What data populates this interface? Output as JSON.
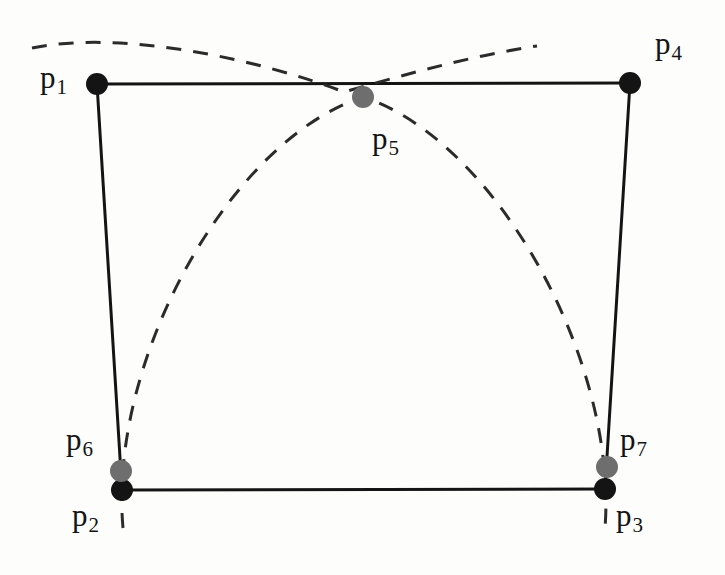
{
  "figure": {
    "kind": "geometry-diagram",
    "width": 725,
    "height": 575,
    "background_color": "#fdfdfc",
    "stroke_color": "#141414",
    "dash_color": "#2b2b2b",
    "vertex_fill_black": "#141414",
    "vertex_fill_gray": "#6e6e6e"
  },
  "points": [
    {
      "id": "p1",
      "label": "p",
      "sub": "1",
      "x": 97,
      "y": 84,
      "color": "#141414",
      "radius": 11,
      "label_x": 40,
      "label_y": 62
    },
    {
      "id": "p2",
      "label": "p",
      "sub": "2",
      "x": 122,
      "y": 490,
      "color": "#141414",
      "radius": 11,
      "label_x": 72,
      "label_y": 500
    },
    {
      "id": "p3",
      "label": "p",
      "sub": "3",
      "x": 605,
      "y": 489,
      "color": "#141414",
      "radius": 11,
      "label_x": 616,
      "label_y": 500
    },
    {
      "id": "p4",
      "label": "p",
      "sub": "4",
      "x": 630,
      "y": 83,
      "color": "#141414",
      "radius": 11,
      "label_x": 655,
      "label_y": 28
    },
    {
      "id": "p5",
      "label": "p",
      "sub": "5",
      "x": 363,
      "y": 97,
      "color": "#6e6e6e",
      "radius": 11,
      "label_x": 372,
      "label_y": 123
    },
    {
      "id": "p6",
      "label": "p",
      "sub": "6",
      "x": 121,
      "y": 471,
      "color": "#6e6e6e",
      "radius": 11,
      "label_x": 66,
      "label_y": 424
    },
    {
      "id": "p7",
      "label": "p",
      "sub": "7",
      "x": 607,
      "y": 467,
      "color": "#6e6e6e",
      "radius": 11,
      "label_x": 620,
      "label_y": 424
    }
  ],
  "solid_edges": [
    {
      "id": "edge-p1-p4",
      "from": "p1",
      "to": "p4",
      "x1": 97,
      "y1": 84,
      "x2": 630,
      "y2": 83
    },
    {
      "id": "edge-p1-p2",
      "from": "p1",
      "to": "p2",
      "x1": 97,
      "y1": 84,
      "x2": 122,
      "y2": 490
    },
    {
      "id": "edge-p4-p3",
      "from": "p4",
      "to": "p3",
      "x1": 630,
      "y1": 83,
      "x2": 605,
      "y2": 489
    },
    {
      "id": "edge-p2-p3",
      "from": "p2",
      "to": "p3",
      "x1": 122,
      "y1": 490,
      "x2": 605,
      "y2": 489
    }
  ],
  "dashed_arcs": [
    {
      "id": "arc-dome-p2-p5-p3",
      "description": "large dashed arc from below p2 up through p5 and down past p7 to below p3",
      "path": "M 123 528 C 108 360 230 140 363 97 C 495 140 618 360 605 528"
    },
    {
      "id": "arc-flat-upper",
      "description": "flatter dashed arc from upper-left crossing near p5 rising to upper-right",
      "path": "M 32 48 C 120 30 255 58 344 92 C 400 76 470 56 537 46"
    }
  ]
}
